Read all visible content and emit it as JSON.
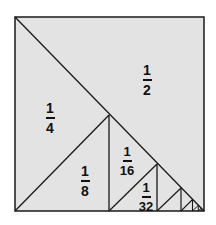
{
  "diagram": {
    "type": "geometric-series-square",
    "background": "#e3e3e3",
    "stroke": "#1a1a1a",
    "labels": [
      {
        "id": "half",
        "numerator": "1",
        "denominator": "2"
      },
      {
        "id": "quarter",
        "numerator": "1",
        "denominator": "4"
      },
      {
        "id": "eighth",
        "numerator": "1",
        "denominator": "8"
      },
      {
        "id": "sixteenth",
        "numerator": "1",
        "denominator": "16"
      },
      {
        "id": "thirtysecond",
        "numerator": "1",
        "denominator": "32"
      }
    ]
  }
}
